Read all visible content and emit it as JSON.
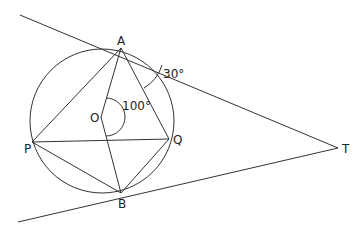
{
  "diagram": {
    "points": {
      "A": {
        "label": "A",
        "x": 121,
        "y": 48
      },
      "B": {
        "label": "B",
        "x": 121,
        "y": 193
      },
      "P": {
        "label": "P",
        "x": 32,
        "y": 142
      },
      "Q": {
        "label": "Q",
        "x": 169,
        "y": 139
      },
      "O": {
        "label": "O",
        "x": 101,
        "y": 117
      },
      "T": {
        "label": "T",
        "x": 338,
        "y": 148
      }
    },
    "angles": {
      "AOQ": "100°",
      "OAT_region": "30°"
    }
  }
}
